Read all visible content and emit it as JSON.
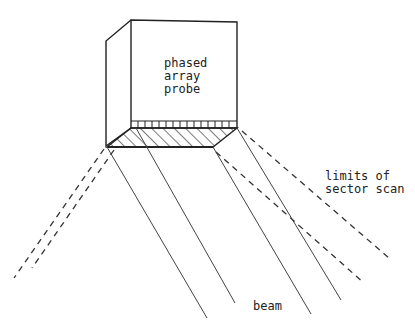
{
  "diagram": {
    "probe_label": [
      "phased",
      "array",
      "probe"
    ],
    "limits_label": [
      "limits of",
      "sector scan"
    ],
    "beam_label": "beam"
  },
  "colors": {
    "line": "#222222",
    "background": "#ffffff"
  }
}
